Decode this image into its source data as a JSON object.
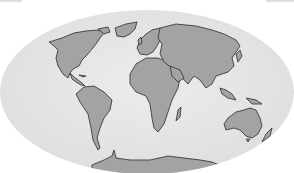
{
  "map": {
    "projection": "elliptical world map",
    "colors": {
      "ocean": "#e6e6e6",
      "land": "#a3a3a3",
      "coast": "#404040",
      "background": "#ffffff"
    },
    "continents": [
      "North America",
      "South America",
      "Europe",
      "Africa",
      "Asia",
      "Australia",
      "Antarctica"
    ]
  }
}
